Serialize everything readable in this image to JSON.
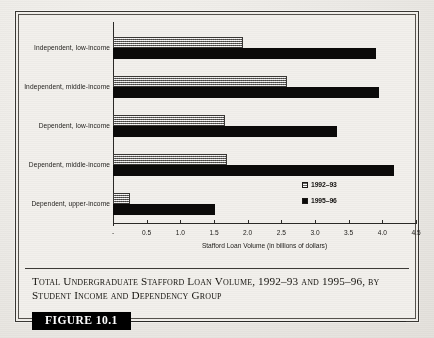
{
  "figure": {
    "badge_label": "FIGURE 10.1",
    "caption": "Total Undergraduate Stafford Loan Volume, 1992–93 and 1995–96, by Student Income and Dependency Group"
  },
  "colors": {
    "series_1992_93": "#a8a6a2",
    "series_1995_96": "#0b0a09",
    "axis": "#2b2926",
    "frame": "#3a3834",
    "badge_background": "#000000",
    "badge_text": "#ffffff",
    "page_background": "#eceae6"
  },
  "chart_data": {
    "type": "bar",
    "orientation": "horizontal",
    "title": "",
    "xlabel": "Stafford Loan Volume (in billions of dollars)",
    "ylabel": "",
    "xlim": [
      0,
      4.5
    ],
    "grid": false,
    "legend_position": "inside-right",
    "categories": [
      "Independent, low-income",
      "Independent, middle-income",
      "Dependent, low-income",
      "Dependent, middle-income",
      "Dependent, upper-income"
    ],
    "xticks": [
      0,
      0.5,
      1.0,
      1.5,
      2.0,
      2.5,
      3.0,
      3.5,
      4.0,
      4.5
    ],
    "xtick_labels": [
      "-",
      "0.5",
      "1.0",
      "1.5",
      "2.0",
      "2.5",
      "3.0",
      "3.5",
      "4.0",
      "4.5"
    ],
    "series": [
      {
        "name": "1992–93",
        "values": [
          1.93,
          2.58,
          1.66,
          1.7,
          0.25
        ]
      },
      {
        "name": "1995–96",
        "values": [
          3.9,
          3.95,
          3.33,
          4.18,
          1.52
        ]
      }
    ]
  }
}
